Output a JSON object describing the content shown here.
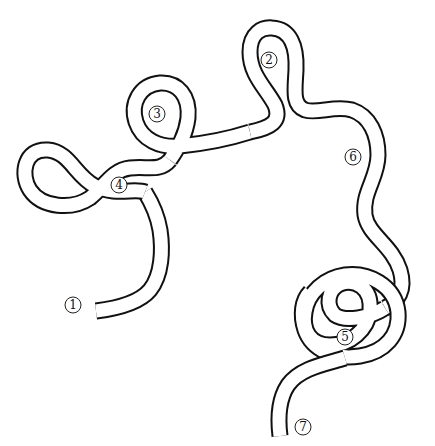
{
  "diagram": {
    "stroke_color": "#111111",
    "fill_color": "#ffffff",
    "labels": [
      {
        "id": "1",
        "text": "1"
      },
      {
        "id": "2",
        "text": "2"
      },
      {
        "id": "3",
        "text": "3"
      },
      {
        "id": "4",
        "text": "4"
      },
      {
        "id": "5",
        "text": "5"
      },
      {
        "id": "6",
        "text": "6"
      },
      {
        "id": "7",
        "text": "7"
      }
    ]
  }
}
